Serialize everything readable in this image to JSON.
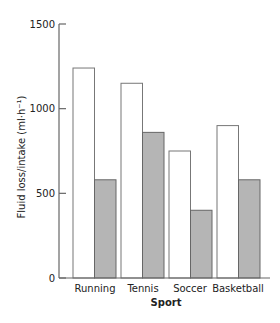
{
  "chart_data": {
    "type": "bar",
    "title": "",
    "xlabel": "Sport",
    "ylabel": "Fluid loss/intake (ml·h⁻¹)",
    "categories": [
      "Running",
      "Tennis",
      "Soccer",
      "Basketball"
    ],
    "series": [
      {
        "name": "Fluid loss",
        "fill": "#ffffff",
        "stroke": "#777777",
        "values": [
          1240,
          1150,
          750,
          900
        ]
      },
      {
        "name": "Fluid intake",
        "fill": "#b5b5b5",
        "stroke": "#666666",
        "values": [
          580,
          860,
          400,
          580
        ]
      }
    ],
    "ylim": [
      0,
      1500
    ],
    "yticks": [
      0,
      500,
      1000,
      1500
    ],
    "ytick_labels": [
      "0",
      "500",
      "1000",
      "1500"
    ],
    "grid": false,
    "legend": null
  }
}
